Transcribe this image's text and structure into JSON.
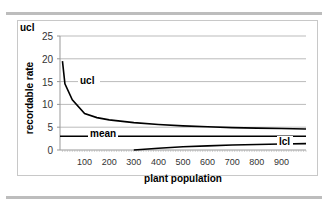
{
  "chart_data": {
    "type": "line",
    "title": "",
    "corner_label": "ucl",
    "xlabel": "plant population",
    "ylabel": "recordable rate",
    "xlim": [
      0,
      1000
    ],
    "ylim": [
      0,
      25
    ],
    "x_ticks": [
      "100",
      "200",
      "300",
      "400",
      "500",
      "600",
      "700",
      "800",
      "900"
    ],
    "y_ticks": [
      "0",
      "5",
      "10",
      "15",
      "20",
      "25"
    ],
    "grid": true,
    "series": [
      {
        "name": "ucl",
        "x": [
          10,
          20,
          50,
          100,
          150,
          200,
          300,
          400,
          500,
          600,
          700,
          800,
          900,
          1000
        ],
        "values": [
          19.5,
          14.5,
          11,
          8,
          7.1,
          6.6,
          6.0,
          5.6,
          5.3,
          5.1,
          4.9,
          4.8,
          4.7,
          4.6
        ]
      },
      {
        "name": "mean",
        "x": [
          0,
          1000
        ],
        "values": [
          3,
          3
        ]
      },
      {
        "name": "lcl",
        "x": [
          300,
          400,
          500,
          600,
          700,
          800,
          900,
          1000
        ],
        "values": [
          0,
          0.4,
          0.7,
          0.9,
          1.1,
          1.2,
          1.3,
          1.4
        ]
      }
    ],
    "annotations": [
      "ucl",
      "mean",
      "lcl"
    ]
  }
}
